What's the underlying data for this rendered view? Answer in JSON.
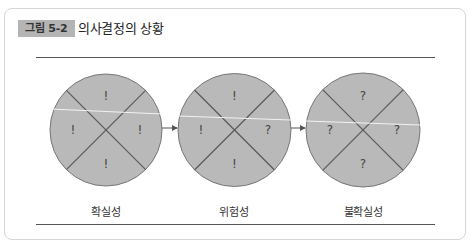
{
  "figure": {
    "badge": "그림 5-2",
    "title": "의사결정의 상황"
  },
  "colors": {
    "circle_fill": "#b9b9b9",
    "circle_stroke": "#666666",
    "divider": "#555555",
    "badge_bg": "#b4b4b4"
  },
  "diagram": {
    "circles": [
      {
        "label": "확실성",
        "top": "!",
        "left": "!",
        "right": "!",
        "bottom": "!"
      },
      {
        "label": "위험성",
        "top": "!",
        "left": "!",
        "right": "?",
        "bottom": "!"
      },
      {
        "label": "불확실성",
        "top": "?",
        "left": "?",
        "right": "?",
        "bottom": "?"
      }
    ],
    "arrows": [
      "circle-1-to-circle-2",
      "circle-2-to-circle-3"
    ]
  }
}
